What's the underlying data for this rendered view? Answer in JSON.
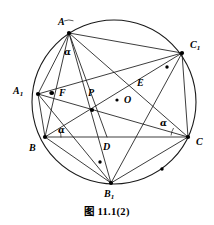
{
  "figure": {
    "caption": "图 11.1(2)",
    "caption_y": 203,
    "stroke_color": "#1a1a1a",
    "background": "#ffffff",
    "circle": {
      "cx": 114,
      "cy": 102,
      "r": 82
    }
  },
  "points": [
    {
      "id": "A",
      "label": "A",
      "sub": "",
      "x": 69,
      "y": 33,
      "lx": 58,
      "ly": 17,
      "dot": true
    },
    {
      "id": "C1",
      "label": "C",
      "sub": "1",
      "x": 182,
      "y": 53,
      "lx": 190,
      "ly": 40,
      "dot": true
    },
    {
      "id": "A1",
      "label": "A",
      "sub": "1",
      "x": 38,
      "y": 94,
      "lx": 13,
      "ly": 86,
      "dot": true
    },
    {
      "id": "B",
      "label": "B",
      "sub": "",
      "x": 45,
      "y": 137,
      "lx": 29,
      "ly": 143,
      "dot": true
    },
    {
      "id": "C",
      "label": "C",
      "sub": "",
      "x": 188,
      "y": 137,
      "lx": 196,
      "ly": 137,
      "dot": true
    },
    {
      "id": "B1",
      "label": "B",
      "sub": "1",
      "x": 111,
      "y": 183,
      "lx": 104,
      "ly": 189,
      "dot": true
    },
    {
      "id": "F",
      "label": "F",
      "sub": "",
      "x": 52,
      "y": 93,
      "lx": 59,
      "ly": 88,
      "dot": true
    },
    {
      "id": "P",
      "label": "P",
      "sub": "",
      "x": 92,
      "y": 110,
      "lx": 88,
      "ly": 88,
      "dot": true
    },
    {
      "id": "E",
      "label": "E",
      "sub": "",
      "x": 132,
      "y": 83,
      "lx": 137,
      "ly": 78,
      "dot": false
    },
    {
      "id": "O",
      "label": "O",
      "sub": "",
      "x": 117,
      "y": 100,
      "lx": 124,
      "ly": 95,
      "dot": true
    },
    {
      "id": "D",
      "label": "D",
      "sub": "",
      "x": 107,
      "y": 137,
      "lx": 103,
      "ly": 142,
      "dot": false
    }
  ],
  "segments": [
    {
      "name": "A-C1",
      "from": "A",
      "to": "C1"
    },
    {
      "name": "A-B",
      "from": "A",
      "to": "B"
    },
    {
      "name": "A-A1",
      "from": "A",
      "to": "A1"
    },
    {
      "name": "A-B1",
      "from": "A",
      "to": "B1"
    },
    {
      "name": "A-C",
      "from": "A",
      "to": "C"
    },
    {
      "name": "A-D",
      "from": "A",
      "to": "D"
    },
    {
      "name": "B-C",
      "from": "B",
      "to": "C"
    },
    {
      "name": "B-C1",
      "from": "B",
      "to": "C1"
    },
    {
      "name": "B-B1",
      "from": "B",
      "to": "B1"
    },
    {
      "name": "B-A1",
      "from": "B",
      "to": "A1"
    },
    {
      "name": "C-A1",
      "from": "C",
      "to": "A1"
    },
    {
      "name": "C-C1",
      "from": "C",
      "to": "C1"
    },
    {
      "name": "C-B1",
      "from": "C",
      "to": "B1"
    },
    {
      "name": "C1-B1",
      "from": "C1",
      "to": "B1"
    },
    {
      "name": "C1-A1",
      "from": "C1",
      "to": "A1"
    },
    {
      "name": "A1-B1",
      "from": "A1",
      "to": "B1"
    }
  ],
  "angle_marks": [
    {
      "id": "alpha-at-A",
      "label": "α",
      "lx": 64,
      "ly": 48,
      "vertex": "A",
      "r": 13,
      "a1": 248,
      "a2": 290
    },
    {
      "id": "alpha-at-B",
      "label": "α",
      "lx": 58,
      "ly": 126,
      "vertex": "B",
      "r": 16,
      "a1": -20,
      "a2": 2
    },
    {
      "id": "alpha-at-C",
      "label": "α",
      "lx": 160,
      "ly": 119,
      "vertex": "C",
      "r": 17,
      "a1": 185,
      "a2": 212
    }
  ],
  "arc_dots": [
    {
      "id": "arc-dot-near-C1",
      "x": 167,
      "y": 67
    },
    {
      "id": "arc-dot-near-A1",
      "x": 51,
      "y": 93
    },
    {
      "id": "arc-dot-lower-left",
      "x": 100,
      "y": 162
    },
    {
      "id": "arc-dot-lower-right",
      "x": 162,
      "y": 169
    }
  ]
}
